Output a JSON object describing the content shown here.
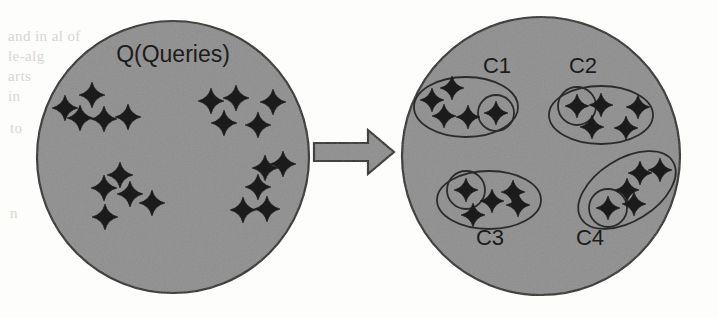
{
  "figure": {
    "colors": {
      "page_background": "#fdfdfb",
      "circle_fill": "#8e8e8e",
      "circle_stroke": "#2b2b2b",
      "arrow_fill": "#8e8e8e",
      "arrow_stroke": "#2b2b2b",
      "ellipse_stroke": "#2b2b2b",
      "star_fill": "#1b1b1b",
      "text_color": "#1b1b1b",
      "ghost_text_color": "#d8d6d2"
    },
    "left_circle": {
      "name": "query-set-circle",
      "label": "Q(Queries)",
      "label_x": 173,
      "label_y": 62,
      "cx": 173,
      "cy": 157,
      "r": 136,
      "stars": [
        {
          "x": 65,
          "y": 108,
          "s": 13
        },
        {
          "x": 92,
          "y": 95,
          "s": 13
        },
        {
          "x": 80,
          "y": 118,
          "s": 13
        },
        {
          "x": 104,
          "y": 119,
          "s": 13
        },
        {
          "x": 128,
          "y": 117,
          "s": 13
        },
        {
          "x": 211,
          "y": 101,
          "s": 13
        },
        {
          "x": 236,
          "y": 98,
          "s": 13
        },
        {
          "x": 273,
          "y": 102,
          "s": 13
        },
        {
          "x": 224,
          "y": 123,
          "s": 13
        },
        {
          "x": 258,
          "y": 125,
          "s": 13
        },
        {
          "x": 104,
          "y": 188,
          "s": 13
        },
        {
          "x": 130,
          "y": 194,
          "s": 13
        },
        {
          "x": 120,
          "y": 175,
          "s": 13
        },
        {
          "x": 152,
          "y": 203,
          "s": 13
        },
        {
          "x": 105,
          "y": 217,
          "s": 13
        },
        {
          "x": 265,
          "y": 168,
          "s": 13
        },
        {
          "x": 283,
          "y": 164,
          "s": 13
        },
        {
          "x": 258,
          "y": 187,
          "s": 13
        },
        {
          "x": 243,
          "y": 210,
          "s": 13
        },
        {
          "x": 267,
          "y": 209,
          "s": 13
        }
      ]
    },
    "arrow": {
      "name": "transform-arrow",
      "x1": 314,
      "x2": 394,
      "y": 152,
      "shaft_half_height": 9,
      "head_half_height": 22,
      "head_length": 26
    },
    "right_circle": {
      "name": "clustered-set-circle",
      "cx": 541,
      "cy": 156,
      "r": 139,
      "clusters": [
        {
          "id": "C1",
          "label": "C1",
          "label_x": 497,
          "label_y": 73,
          "ellipse": {
            "cx": 466,
            "cy": 107,
            "rx": 52,
            "ry": 30,
            "rotate": 0
          },
          "core": {
            "cx": 496,
            "cy": 113,
            "r": 18
          },
          "stars": [
            {
              "x": 432,
              "y": 100,
              "s": 12
            },
            {
              "x": 452,
              "y": 88,
              "s": 12
            },
            {
              "x": 444,
              "y": 116,
              "s": 12
            },
            {
              "x": 468,
              "y": 117,
              "s": 12
            },
            {
              "x": 496,
              "y": 113,
              "s": 12
            }
          ]
        },
        {
          "id": "C2",
          "label": "C2",
          "label_x": 583,
          "label_y": 73,
          "ellipse": {
            "cx": 601,
            "cy": 115,
            "rx": 52,
            "ry": 29,
            "rotate": 0
          },
          "core": {
            "cx": 577,
            "cy": 106,
            "r": 19
          },
          "stars": [
            {
              "x": 577,
              "y": 106,
              "s": 12
            },
            {
              "x": 601,
              "y": 105,
              "s": 12
            },
            {
              "x": 638,
              "y": 107,
              "s": 12
            },
            {
              "x": 592,
              "y": 127,
              "s": 12
            },
            {
              "x": 626,
              "y": 128,
              "s": 12
            }
          ]
        },
        {
          "id": "C3",
          "label": "C3",
          "label_x": 490,
          "label_y": 245,
          "ellipse": {
            "cx": 489,
            "cy": 200,
            "rx": 52,
            "ry": 29,
            "rotate": 0
          },
          "core": {
            "cx": 466,
            "cy": 190,
            "r": 19
          },
          "stars": [
            {
              "x": 466,
              "y": 190,
              "s": 12
            },
            {
              "x": 492,
              "y": 201,
              "s": 12
            },
            {
              "x": 513,
              "y": 192,
              "s": 12
            },
            {
              "x": 518,
              "y": 205,
              "s": 12
            },
            {
              "x": 473,
              "y": 215,
              "s": 12
            }
          ]
        },
        {
          "id": "C4",
          "label": "C4",
          "label_x": 590,
          "label_y": 245,
          "ellipse": {
            "cx": 627,
            "cy": 190,
            "rx": 54,
            "ry": 31,
            "rotate": -32
          },
          "core": {
            "cx": 608,
            "cy": 208,
            "r": 19
          },
          "stars": [
            {
              "x": 608,
              "y": 208,
              "s": 12
            },
            {
              "x": 634,
              "y": 204,
              "s": 12
            },
            {
              "x": 627,
              "y": 190,
              "s": 12
            },
            {
              "x": 640,
              "y": 173,
              "s": 12
            },
            {
              "x": 660,
              "y": 170,
              "s": 12
            }
          ]
        }
      ]
    },
    "ghost_background_text": [
      "and  in  al  of",
      "le-alg",
      "arts",
      "in",
      "to",
      "n",
      "use of the",
      "to ssn",
      "is, by",
      "ti",
      "s",
      "the",
      "o",
      "t (4)",
      "o"
    ]
  }
}
